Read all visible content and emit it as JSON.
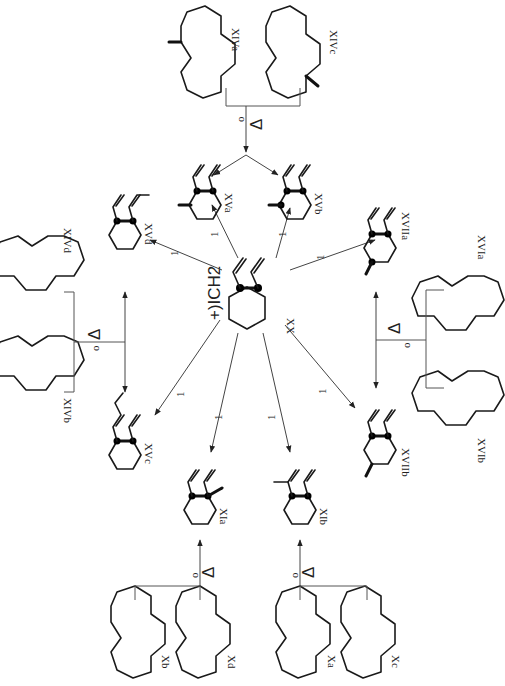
{
  "diagram": {
    "type": "chemical-reaction-scheme",
    "orientation": "rotated-90-clockwise",
    "center": {
      "compound": "XX",
      "reagent": "+)ICH2",
      "description": "1,2-divinylcyclohexane"
    },
    "arrow_label": "1",
    "heat_label": "Δ",
    "heat_sublabel": "o",
    "products": [
      {
        "id": "XVa",
        "label": "XVa"
      },
      {
        "id": "XVb",
        "label": "XVb"
      },
      {
        "id": "XVc",
        "label": "XVc"
      },
      {
        "id": "XVd",
        "label": "XVd"
      },
      {
        "id": "XIa",
        "label": "XIa"
      },
      {
        "id": "XIb",
        "label": "XIb"
      },
      {
        "id": "XVIIa",
        "label": "XVIIa"
      },
      {
        "id": "XVIIb",
        "label": "XVIIb"
      }
    ],
    "precursors": [
      {
        "group": "top",
        "labels": [
          "XIVa",
          "XIVc"
        ],
        "targets": [
          "XVa",
          "XVb"
        ]
      },
      {
        "group": "left-upper",
        "labels": [
          "XIVd",
          "XIVb"
        ],
        "targets": [
          "XVd",
          "XVc"
        ]
      },
      {
        "group": "right",
        "labels": [
          "XVIa",
          "XVIb"
        ],
        "targets": [
          "XVIIa",
          "XVIIb"
        ]
      },
      {
        "group": "bottom-left",
        "labels": [
          "Xb",
          "Xd"
        ],
        "targets": [
          "XIa"
        ]
      },
      {
        "group": "bottom-right",
        "labels": [
          "Xa",
          "Xc"
        ],
        "targets": [
          "XIb"
        ]
      }
    ]
  }
}
